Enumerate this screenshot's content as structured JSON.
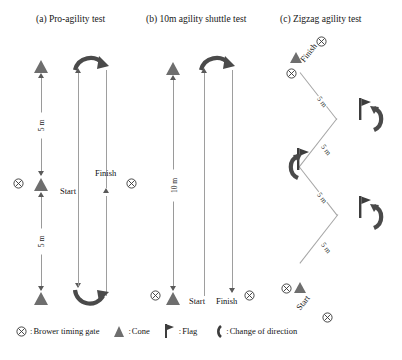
{
  "figure": {
    "scan_artifact": "",
    "panels": [
      {
        "id": "a",
        "title": "(a) Pro-agility test",
        "start_label": "Start",
        "finish_label": "Finish",
        "distances": [
          "5 m",
          "5 m"
        ],
        "cones": 3,
        "gates": 2,
        "direction_changes": 2
      },
      {
        "id": "b",
        "title": "(b) 10m agility shuttle test",
        "start_label": "Start",
        "finish_label": "Finish",
        "distances": [
          "10 m"
        ],
        "cones": 1,
        "gates": 2,
        "direction_changes": 1
      },
      {
        "id": "c",
        "title": "(c) Zigzag agility test",
        "start_label": "Start",
        "finish_label": "Finish",
        "distances": [
          "5 m",
          "5 m",
          "5 m",
          "5 m"
        ],
        "cones": 2,
        "gates": 4,
        "flags": 3,
        "direction_changes": 3
      }
    ]
  },
  "legend": {
    "items": [
      {
        "icon": "timing-gate-icon",
        "separator": ":",
        "label": "Brower timing gate"
      },
      {
        "icon": "cone-icon",
        "separator": ":",
        "label": "Cone"
      },
      {
        "icon": "flag-icon",
        "separator": ":",
        "label": "Flag"
      },
      {
        "icon": "change-of-direction-icon",
        "separator": ":",
        "label": "Change of direction"
      }
    ]
  },
  "colors": {
    "cone": "#6e6e6e",
    "flag": "#3d3d3d",
    "arc": "#4a4a4a",
    "line": "#9e9e9e",
    "gate": "#3a3a3a",
    "text": "#141414"
  }
}
